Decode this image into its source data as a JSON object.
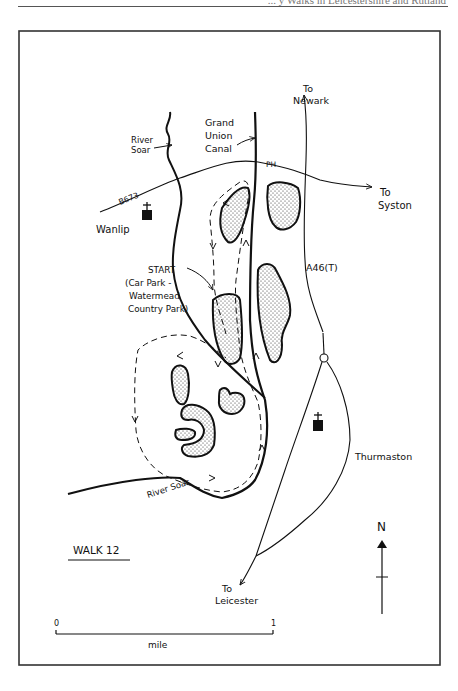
{
  "header": {
    "running_title": "... y Walks in Leicestershire and Rutland"
  },
  "map": {
    "title": "WALK 12",
    "labels": {
      "river_soar_north": [
        "River",
        "Soar"
      ],
      "grand_union_canal": [
        "Grand",
        "Union",
        "Canal"
      ],
      "to_newark": [
        "To",
        "Newark"
      ],
      "pub": "PH",
      "b673": "B673",
      "to_syston": [
        "To",
        "Syston"
      ],
      "wanlip": "Wanlip",
      "start": [
        "START",
        "(Car Park -",
        "Watermead",
        "Country Park)"
      ],
      "a46": "A46(T)",
      "thurmaston": "Thurmaston",
      "river_soar_south": "River Soar",
      "to_leicester": [
        "To",
        "Leicester"
      ]
    },
    "north_arrow": {
      "label": "N"
    },
    "scale_bar": {
      "start": "0",
      "end": "1",
      "unit": "mile"
    },
    "colors": {
      "ink": "#111111",
      "frame": "#333333",
      "background": "#ffffff"
    }
  }
}
